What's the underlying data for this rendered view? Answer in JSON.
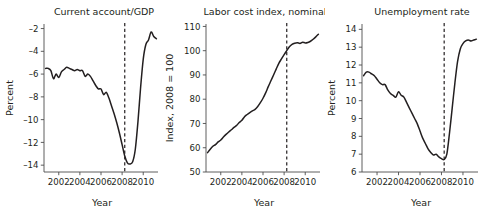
{
  "figure": {
    "background_color": "#ffffff",
    "line_color": "#231f20",
    "axis_color": "#4d4d4d",
    "event_marker_label": "2008.25"
  },
  "chart_data": [
    {
      "type": "line",
      "panel_index": 1,
      "title": "Current account/GDP",
      "xlabel": "Year",
      "ylabel": "Percent",
      "xlim": [
        2000.6,
        2011.4
      ],
      "ylim": [
        -14.6,
        -1.6
      ],
      "xticks": [
        2002,
        2004,
        2006,
        2008,
        2010
      ],
      "xticklabels": [
        "2002",
        "2004",
        "2006",
        "2008",
        "2010"
      ],
      "yticks": [
        -2,
        -4,
        -6,
        -8,
        -10,
        -12,
        -14
      ],
      "yticklabels": [
        "–2",
        "–4",
        "–6",
        "–8",
        "–10",
        "–12",
        "–14"
      ],
      "grid": false,
      "legend": "none",
      "annotations": [
        {
          "kind": "vertical-dashed-line",
          "x": 2008.25,
          "label": "crisis onset"
        }
      ],
      "series": [
        {
          "name": "Current account balance, percent of GDP",
          "x": [
            2000.75,
            2001.0,
            2001.25,
            2001.5,
            2001.75,
            2002.0,
            2002.25,
            2002.5,
            2002.75,
            2003.0,
            2003.25,
            2003.5,
            2003.75,
            2004.0,
            2004.25,
            2004.5,
            2004.75,
            2005.0,
            2005.25,
            2005.5,
            2005.75,
            2006.0,
            2006.25,
            2006.5,
            2006.75,
            2007.0,
            2007.25,
            2007.5,
            2007.75,
            2008.0,
            2008.25,
            2008.5,
            2008.75,
            2009.0,
            2009.25,
            2009.5,
            2009.75,
            2010.0,
            2010.25,
            2010.5,
            2010.75,
            2011.0,
            2011.25
          ],
          "y": [
            -5.5,
            -5.5,
            -5.7,
            -6.4,
            -6.0,
            -6.3,
            -5.8,
            -5.6,
            -5.4,
            -5.5,
            -5.6,
            -5.7,
            -5.6,
            -5.7,
            -5.7,
            -6.2,
            -6.0,
            -6.2,
            -6.6,
            -7.0,
            -7.3,
            -7.3,
            -7.8,
            -7.6,
            -8.1,
            -8.8,
            -9.5,
            -10.3,
            -11.2,
            -12.2,
            -13.2,
            -13.8,
            -13.9,
            -13.7,
            -12.6,
            -10.2,
            -7.2,
            -4.7,
            -3.4,
            -3.0,
            -2.3,
            -2.7,
            -2.9
          ]
        }
      ]
    },
    {
      "type": "line",
      "panel_index": 2,
      "title": "Labor cost index, nominal",
      "xlabel": "Year",
      "ylabel": "Index, 2008 = 100",
      "xlim": [
        2000.6,
        2011.4
      ],
      "ylim": [
        50,
        111
      ],
      "xticks": [
        2002,
        2004,
        2006,
        2008,
        2010
      ],
      "xticklabels": [
        "2002",
        "2004",
        "2006",
        "2008",
        "2010"
      ],
      "yticks": [
        50,
        60,
        70,
        80,
        90,
        100,
        110
      ],
      "yticklabels": [
        "50",
        "60",
        "70",
        "80",
        "90",
        "100",
        "110"
      ],
      "grid": false,
      "legend": "none",
      "annotations": [
        {
          "kind": "vertical-dashed-line",
          "x": 2008.25,
          "label": "crisis onset"
        }
      ],
      "series": [
        {
          "name": "Nominal labor cost index (2008 = 100)",
          "x": [
            2000.75,
            2001.0,
            2001.25,
            2001.5,
            2001.75,
            2002.0,
            2002.25,
            2002.5,
            2002.75,
            2003.0,
            2003.25,
            2003.5,
            2003.75,
            2004.0,
            2004.25,
            2004.5,
            2004.75,
            2005.0,
            2005.25,
            2005.5,
            2005.75,
            2006.0,
            2006.25,
            2006.5,
            2006.75,
            2007.0,
            2007.25,
            2007.5,
            2007.75,
            2008.0,
            2008.25,
            2008.5,
            2008.75,
            2009.0,
            2009.25,
            2009.5,
            2009.75,
            2010.0,
            2010.25,
            2010.5,
            2010.75,
            2011.0,
            2011.25
          ],
          "y": [
            58.0,
            59.4,
            60.6,
            61.3,
            62.4,
            63.2,
            64.4,
            65.5,
            66.5,
            67.4,
            68.4,
            69.2,
            70.4,
            71.3,
            72.8,
            73.7,
            74.5,
            75.2,
            75.8,
            77.0,
            78.6,
            80.4,
            82.6,
            85.2,
            87.6,
            90.0,
            92.4,
            94.8,
            96.6,
            98.4,
            100.0,
            101.6,
            102.6,
            103.1,
            103.3,
            103.0,
            103.5,
            103.2,
            103.4,
            103.9,
            104.7,
            105.7,
            106.8
          ]
        }
      ]
    },
    {
      "type": "line",
      "panel_index": 3,
      "title": "Unemployment rate",
      "xlabel": "Year",
      "ylabel": "Percent",
      "xlim": [
        2000.6,
        2011.4
      ],
      "ylim": [
        6,
        14.3
      ],
      "xticks": [
        2002,
        2004,
        2006,
        2008,
        2010
      ],
      "xticklabels": [
        "2002",
        "2004",
        "2006",
        "2008",
        "2010"
      ],
      "yticks": [
        6,
        7,
        8,
        9,
        10,
        11,
        12,
        13,
        14
      ],
      "yticklabels": [
        "6",
        "7",
        "8",
        "9",
        "10",
        "11",
        "12",
        "13",
        "14"
      ],
      "grid": false,
      "legend": "none",
      "annotations": [
        {
          "kind": "vertical-dashed-line",
          "x": 2008.25,
          "label": "crisis onset"
        }
      ],
      "series": [
        {
          "name": "Unemployment rate, percent",
          "x": [
            2000.75,
            2001.0,
            2001.25,
            2001.5,
            2001.75,
            2002.0,
            2002.25,
            2002.5,
            2002.75,
            2003.0,
            2003.25,
            2003.5,
            2003.75,
            2004.0,
            2004.25,
            2004.5,
            2004.75,
            2005.0,
            2005.25,
            2005.5,
            2005.75,
            2006.0,
            2006.25,
            2006.5,
            2006.75,
            2007.0,
            2007.25,
            2007.5,
            2007.75,
            2008.0,
            2008.25,
            2008.5,
            2008.75,
            2009.0,
            2009.25,
            2009.5,
            2009.75,
            2010.0,
            2010.25,
            2010.5,
            2010.75,
            2011.0,
            2011.25
          ],
          "y": [
            11.4,
            11.6,
            11.6,
            11.5,
            11.4,
            11.2,
            11.0,
            10.9,
            10.9,
            10.6,
            10.4,
            10.3,
            10.2,
            10.5,
            10.3,
            10.2,
            9.9,
            9.6,
            9.3,
            9.0,
            8.7,
            8.3,
            7.9,
            7.6,
            7.3,
            7.1,
            6.95,
            7.0,
            6.85,
            6.75,
            6.7,
            7.0,
            8.2,
            9.6,
            11.0,
            12.2,
            12.9,
            13.2,
            13.35,
            13.4,
            13.35,
            13.4,
            13.45
          ]
        }
      ]
    }
  ]
}
